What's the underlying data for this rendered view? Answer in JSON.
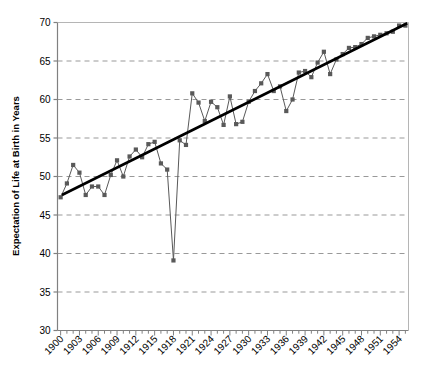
{
  "chart_data": {
    "type": "line",
    "title": "",
    "xlabel": "",
    "ylabel": "Expectation of Life at Birth in Years",
    "xlim": [
      1899.5,
      1955.5
    ],
    "ylim": [
      30,
      70
    ],
    "yticks": [
      30,
      35,
      40,
      45,
      50,
      55,
      60,
      65,
      70
    ],
    "ytick_labels": [
      "30",
      "35",
      "40",
      "45",
      "50",
      "55",
      "60",
      "65",
      "70"
    ],
    "xtick_labels": [
      "1900",
      "1903",
      "1906",
      "1909",
      "1912",
      "1915",
      "1918",
      "1921",
      "1924",
      "1927",
      "1930",
      "1933",
      "1936",
      "1939",
      "1942",
      "1945",
      "1948",
      "1951",
      "1954"
    ],
    "xtick_values": [
      1900,
      1903,
      1906,
      1909,
      1912,
      1915,
      1918,
      1921,
      1924,
      1927,
      1930,
      1933,
      1936,
      1939,
      1942,
      1945,
      1948,
      1951,
      1954
    ],
    "xtick_rotation": -45,
    "minor_xticks_every": 1,
    "grid": {
      "horizontal": true,
      "vertical": false,
      "style": "dashed",
      "color": "#999999"
    },
    "legend": {
      "visible": false
    },
    "series": [
      {
        "name": "Expectation of life at birth",
        "color": "#595959",
        "marker": "square",
        "marker_size": 4.2,
        "line_width": 1,
        "x": [
          1900,
          1901,
          1902,
          1903,
          1904,
          1905,
          1906,
          1907,
          1908,
          1909,
          1910,
          1911,
          1912,
          1913,
          1914,
          1915,
          1916,
          1917,
          1918,
          1919,
          1920,
          1921,
          1922,
          1923,
          1924,
          1925,
          1926,
          1927,
          1928,
          1929,
          1930,
          1931,
          1932,
          1933,
          1934,
          1935,
          1936,
          1937,
          1938,
          1939,
          1940,
          1941,
          1942,
          1943,
          1944,
          1945,
          1946,
          1947,
          1948,
          1949,
          1950,
          1951,
          1952,
          1953,
          1954,
          1955
        ],
        "y": [
          47.3,
          49.1,
          51.5,
          50.5,
          47.6,
          48.7,
          48.7,
          47.6,
          50.2,
          52.1,
          50.0,
          52.6,
          53.5,
          52.5,
          54.2,
          54.5,
          51.7,
          50.9,
          39.1,
          54.7,
          54.1,
          60.8,
          59.6,
          57.2,
          59.7,
          59.0,
          56.7,
          60.4,
          56.8,
          57.1,
          59.7,
          61.1,
          62.1,
          63.3,
          61.1,
          61.7,
          58.5,
          60.0,
          63.5,
          63.7,
          62.9,
          64.8,
          66.2,
          63.3,
          65.2,
          65.9,
          66.7,
          66.8,
          67.2,
          68.0,
          68.2,
          68.4,
          68.6,
          68.8,
          69.6,
          69.6
        ]
      }
    ],
    "trendline": {
      "name": "Linear trend",
      "color": "#000000",
      "line_width": 2.6,
      "x_start": 1900.2,
      "y_start": 47.6,
      "x_end": 1955.3,
      "y_end": 69.9
    }
  }
}
